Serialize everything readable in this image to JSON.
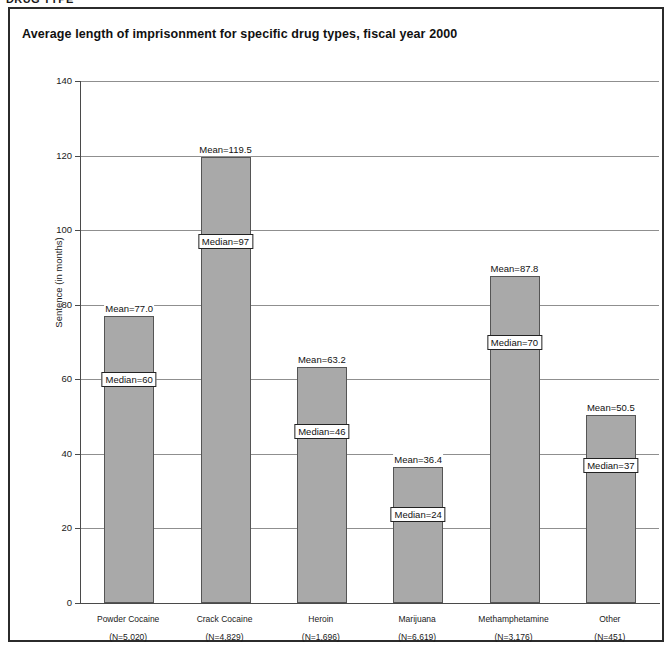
{
  "header": {
    "cropped_text": "DRUG TYPE"
  },
  "chart_data": {
    "type": "bar",
    "title": "Average length of imprisonment for specific drug types, fiscal year 2000",
    "xlabel": "",
    "ylabel": "Sentence (in months)",
    "ylim": [
      0,
      140
    ],
    "ytick_labels": [
      "0",
      "20",
      "40",
      "60",
      "80",
      "100",
      "120",
      "140"
    ],
    "ytick_values": [
      0,
      20,
      40,
      60,
      80,
      100,
      120,
      140
    ],
    "grid": true,
    "legend": "none",
    "bar_color": "#a9a9a9",
    "categories": [
      "Powder Cocaine",
      "Crack Cocaine",
      "Heroin",
      "Marijuana",
      "Methamphetamine",
      "Other"
    ],
    "category_counts": [
      "(N=5,020)",
      "(N=4,829)",
      "(N=1,696)",
      "(N=6,619)",
      "(N=3,176)",
      "(N=451)"
    ],
    "values": [
      77.0,
      119.5,
      63.2,
      36.4,
      87.8,
      50.5
    ],
    "series": [
      {
        "name": "Mean",
        "values": [
          77.0,
          119.5,
          63.2,
          36.4,
          87.8,
          50.5
        ],
        "labels": [
          "Mean=77.0",
          "Mean=119.5",
          "Mean=63.2",
          "Mean=36.4",
          "Mean=87.8",
          "Mean=50.5"
        ]
      },
      {
        "name": "Median",
        "values": [
          60,
          97,
          46,
          24,
          70,
          37
        ],
        "labels": [
          "Median=60",
          "Median=97",
          "Median=46",
          "Median=24",
          "Median=70",
          "Median=37"
        ]
      }
    ]
  }
}
